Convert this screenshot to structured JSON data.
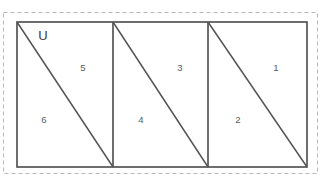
{
  "figure": {
    "universe_label": "U",
    "background_color": "#ffffff",
    "outer_border_color": "#b8b8b8",
    "shape_stroke_color": "#4a4a4a",
    "diagonal_stroke_color": "#555555",
    "label_color": "#5a5a5a",
    "outer_border": {
      "x": 3,
      "y": 12,
      "width": 315,
      "height": 162
    },
    "main_rect": {
      "x": 17,
      "y": 22,
      "width": 290,
      "height": 145
    },
    "dividers": [
      {
        "name": "divider-1",
        "x": 113,
        "y1": 22,
        "y2": 167
      },
      {
        "name": "divider-2",
        "x": 208,
        "y1": 22,
        "y2": 167
      }
    ],
    "diagonals": [
      {
        "name": "diagonal-cell-1",
        "x1": 17,
        "y1": 22,
        "x2": 113,
        "y2": 167
      },
      {
        "name": "diagonal-cell-2",
        "x1": 113,
        "y1": 22,
        "x2": 208,
        "y2": 167
      },
      {
        "name": "diagonal-cell-3",
        "x1": 208,
        "y1": 22,
        "x2": 307,
        "y2": 167
      }
    ],
    "universe_label_pos": {
      "x": 43,
      "y": 37
    },
    "regions": [
      {
        "id": "region-6",
        "label": "6",
        "x": 44,
        "y": 120,
        "cell": 1,
        "position": "lower-left"
      },
      {
        "id": "region-5",
        "label": "5",
        "x": 83,
        "y": 68,
        "cell": 1,
        "position": "upper-right"
      },
      {
        "id": "region-4",
        "label": "4",
        "x": 141,
        "y": 120,
        "cell": 2,
        "position": "lower-left"
      },
      {
        "id": "region-3",
        "label": "3",
        "x": 180,
        "y": 68,
        "cell": 2,
        "position": "upper-right"
      },
      {
        "id": "region-2",
        "label": "2",
        "x": 238,
        "y": 120,
        "cell": 3,
        "position": "lower-left"
      },
      {
        "id": "region-1",
        "label": "1",
        "x": 276,
        "y": 68,
        "cell": 3,
        "position": "upper-right"
      }
    ]
  }
}
